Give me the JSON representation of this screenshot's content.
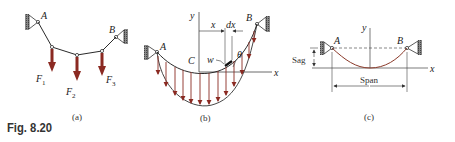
{
  "figure": {
    "caption": "Fig. 8.20",
    "panels": [
      {
        "id": "a",
        "label": "(a)",
        "supports": [
          "A",
          "B"
        ],
        "forces": [
          "F",
          "F",
          "F"
        ],
        "force_subscripts": [
          "1",
          "2",
          "3"
        ]
      },
      {
        "id": "b",
        "label": "(b)",
        "points": [
          "A",
          "B",
          "C"
        ],
        "axes": {
          "x": "x",
          "y": "y"
        },
        "dimension_labels": [
          "x",
          "dx"
        ],
        "load_label": "w",
        "angle_label": "θ"
      },
      {
        "id": "c",
        "label": "(c)",
        "supports": [
          "A",
          "B"
        ],
        "axes": {
          "x": "x",
          "y": "y"
        },
        "dimension_labels": {
          "sag": "Sag",
          "span": "Span"
        }
      }
    ],
    "colors": {
      "force_arrow": "#8b2a22",
      "cable": "#2a2a2a",
      "cable_c": "#8b3a2a",
      "support_hatch": "#666666"
    }
  }
}
